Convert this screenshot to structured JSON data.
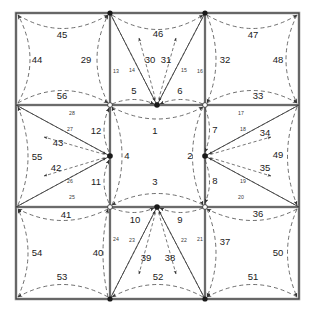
{
  "figure": {
    "type": "graph-diagram",
    "title": "",
    "grid": {
      "rows": 3,
      "cols": 3,
      "x0": 16,
      "y0": 13,
      "x1": 299,
      "y1": 299
    },
    "nodes_total": 16,
    "colors": {
      "line": "#2b2b2b",
      "dash": "#555555",
      "text": "#1a1a1a",
      "border": "#808080"
    }
  },
  "labels": {
    "center_cell": {
      "top": "1",
      "right": "2",
      "bottom": "3",
      "left": "4"
    },
    "hub_top": {
      "left": "5",
      "right": "6"
    },
    "hub_right": {
      "top": "7",
      "bottom": "8"
    },
    "hub_bottom": {
      "right": "9",
      "left": "10"
    },
    "hub_left": {
      "bottom": "11",
      "top": "12"
    },
    "spokes_top": [
      "13",
      "14",
      "15",
      "16"
    ],
    "spokes_right": [
      "17",
      "18",
      "19",
      "20"
    ],
    "spokes_bottom": [
      "21",
      "22",
      "23",
      "24"
    ],
    "spokes_left": [
      "25",
      "26",
      "27",
      "28"
    ],
    "top_left_cell": {
      "top": "45",
      "left": "44",
      "right": "29",
      "bottom": "56"
    },
    "top_mid_cell": {
      "top": "46",
      "left": "30",
      "right": "31"
    },
    "top_right_cell": {
      "top": "47",
      "right": "48",
      "left": "32",
      "bottom": "33"
    },
    "mid_left_cell": {
      "left": "55",
      "upper": "43",
      "lower": "42"
    },
    "mid_right_cell": {
      "right": "49",
      "upper": "34",
      "lower": "35"
    },
    "bot_left_cell": {
      "top": "41",
      "left": "54",
      "right": "40",
      "bottom": "53"
    },
    "bot_mid_cell": {
      "left": "39",
      "right": "38",
      "bottom": "52"
    },
    "bot_right_cell": {
      "top": "36",
      "right": "50",
      "left": "37",
      "bottom": "51"
    }
  },
  "chart_data": {
    "type": "diagram",
    "edge_labels": [
      1,
      2,
      3,
      4,
      5,
      6,
      7,
      8,
      9,
      10,
      11,
      12,
      13,
      14,
      15,
      16,
      17,
      18,
      19,
      20,
      21,
      22,
      23,
      24,
      25,
      26,
      27,
      28,
      29,
      30,
      31,
      32,
      33,
      34,
      35,
      36,
      37,
      38,
      39,
      40,
      41,
      42,
      43,
      44,
      45,
      46,
      47,
      48,
      49,
      50,
      51,
      52,
      53,
      54,
      55,
      56
    ],
    "label_positions": [
      {
        "id": "1",
        "x": 155,
        "y": 131
      },
      {
        "id": "2",
        "x": 190,
        "y": 156
      },
      {
        "id": "3",
        "x": 155,
        "y": 182
      },
      {
        "id": "4",
        "x": 127,
        "y": 156
      },
      {
        "id": "5",
        "x": 134,
        "y": 91
      },
      {
        "id": "6",
        "x": 180,
        "y": 91
      },
      {
        "id": "7",
        "x": 215,
        "y": 130
      },
      {
        "id": "8",
        "x": 215,
        "y": 181
      },
      {
        "id": "9",
        "x": 180,
        "y": 220
      },
      {
        "id": "10",
        "x": 135,
        "y": 220
      },
      {
        "id": "11",
        "x": 96,
        "y": 182
      },
      {
        "id": "12",
        "x": 96,
        "y": 131
      },
      {
        "id": "13",
        "x": 116,
        "y": 72,
        "small": true
      },
      {
        "id": "14",
        "x": 132,
        "y": 71,
        "small": true
      },
      {
        "id": "15",
        "x": 184,
        "y": 71,
        "small": true
      },
      {
        "id": "16",
        "x": 200,
        "y": 72,
        "small": true
      },
      {
        "id": "17",
        "x": 241,
        "y": 114,
        "small": true
      },
      {
        "id": "18",
        "x": 243,
        "y": 130,
        "small": true
      },
      {
        "id": "19",
        "x": 243,
        "y": 182,
        "small": true
      },
      {
        "id": "20",
        "x": 241,
        "y": 198,
        "small": true
      },
      {
        "id": "21",
        "x": 200,
        "y": 240,
        "small": true
      },
      {
        "id": "22",
        "x": 184,
        "y": 241,
        "small": true
      },
      {
        "id": "23",
        "x": 132,
        "y": 241,
        "small": true
      },
      {
        "id": "24",
        "x": 116,
        "y": 240,
        "small": true
      },
      {
        "id": "25",
        "x": 72,
        "y": 198,
        "small": true
      },
      {
        "id": "26",
        "x": 70,
        "y": 182,
        "small": true
      },
      {
        "id": "27",
        "x": 70,
        "y": 130,
        "small": true
      },
      {
        "id": "28",
        "x": 72,
        "y": 114,
        "small": true
      },
      {
        "id": "29",
        "x": 86,
        "y": 60
      },
      {
        "id": "30",
        "x": 150,
        "y": 60
      },
      {
        "id": "31",
        "x": 166,
        "y": 60
      },
      {
        "id": "32",
        "x": 225,
        "y": 60
      },
      {
        "id": "33",
        "x": 258,
        "y": 96
      },
      {
        "id": "34",
        "x": 265,
        "y": 133
      },
      {
        "id": "35",
        "x": 265,
        "y": 168
      },
      {
        "id": "36",
        "x": 258,
        "y": 214
      },
      {
        "id": "37",
        "x": 225,
        "y": 242
      },
      {
        "id": "38",
        "x": 170,
        "y": 258
      },
      {
        "id": "39",
        "x": 146,
        "y": 258
      },
      {
        "id": "40",
        "x": 98,
        "y": 253
      },
      {
        "id": "41",
        "x": 66,
        "y": 215
      },
      {
        "id": "42",
        "x": 56,
        "y": 168
      },
      {
        "id": "43",
        "x": 58,
        "y": 143
      },
      {
        "id": "44",
        "x": 37,
        "y": 60
      },
      {
        "id": "45",
        "x": 62,
        "y": 35
      },
      {
        "id": "46",
        "x": 158,
        "y": 34
      },
      {
        "id": "47",
        "x": 253,
        "y": 35
      },
      {
        "id": "48",
        "x": 278,
        "y": 60
      },
      {
        "id": "49",
        "x": 278,
        "y": 155
      },
      {
        "id": "50",
        "x": 278,
        "y": 253
      },
      {
        "id": "51",
        "x": 253,
        "y": 277
      },
      {
        "id": "52",
        "x": 158,
        "y": 277
      },
      {
        "id": "53",
        "x": 62,
        "y": 277
      },
      {
        "id": "54",
        "x": 37,
        "y": 253
      },
      {
        "id": "55",
        "x": 37,
        "y": 157
      }
    ],
    "label_56": {
      "id": "56",
      "x": 62,
      "y": 96
    }
  }
}
